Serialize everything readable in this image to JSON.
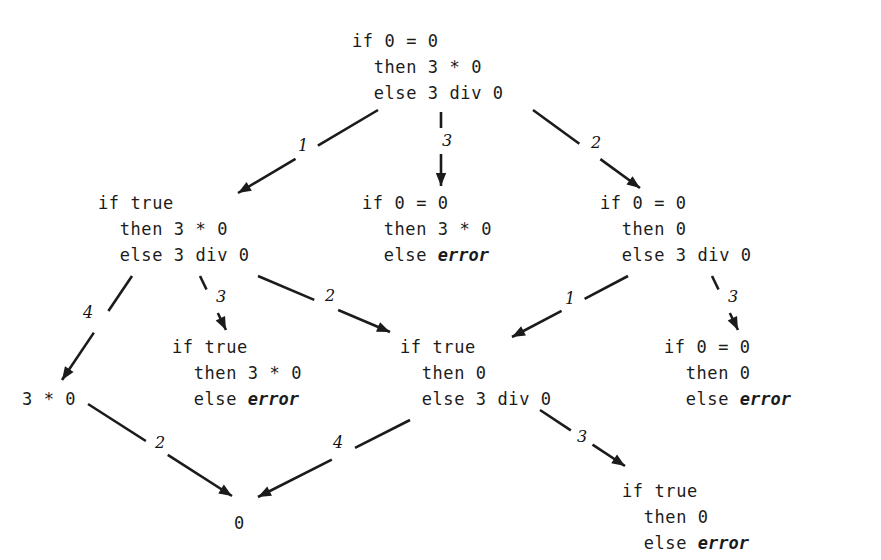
{
  "diagram": {
    "ink_color": "#1b1b1b",
    "background_color": "#ffffff",
    "error_token": "error",
    "nodes": [
      {
        "id": "n-root",
        "lines": [
          "if 0 = 0",
          "  then 3 * 0",
          "  else 3 div 0"
        ],
        "has_error": false,
        "x": 352,
        "y": 28
      },
      {
        "id": "n-l2-left",
        "lines": [
          "if true",
          "  then 3 * 0",
          "  else 3 div 0"
        ],
        "has_error": false,
        "x": 98,
        "y": 190
      },
      {
        "id": "n-l2-mid",
        "lines": [
          "if 0 = 0",
          "  then 3 * 0",
          "  else "
        ],
        "error_line_index": 2,
        "has_error": true,
        "x": 362,
        "y": 190
      },
      {
        "id": "n-l2-right",
        "lines": [
          "if 0 = 0",
          "  then 0",
          "  else 3 div 0"
        ],
        "has_error": false,
        "x": 600,
        "y": 190
      },
      {
        "id": "n-l3-left",
        "lines": [
          "if true",
          "  then 3 * 0",
          "  else "
        ],
        "error_line_index": 2,
        "has_error": true,
        "x": 172,
        "y": 334
      },
      {
        "id": "n-l3-mid",
        "lines": [
          "if true",
          "  then 0",
          "  else 3 div 0"
        ],
        "has_error": false,
        "x": 400,
        "y": 334
      },
      {
        "id": "n-l3-right",
        "lines": [
          "if 0 = 0",
          "  then 0",
          "  else "
        ],
        "error_line_index": 2,
        "has_error": true,
        "x": 664,
        "y": 334
      },
      {
        "id": "n-l4-mul",
        "lines": [
          "3 * 0"
        ],
        "has_error": false,
        "x": 22,
        "y": 386
      },
      {
        "id": "n-l4-right",
        "lines": [
          "if true",
          "  then 0",
          "  else "
        ],
        "error_line_index": 2,
        "has_error": true,
        "x": 622,
        "y": 478
      },
      {
        "id": "n-bottom-zero",
        "lines": [
          "0"
        ],
        "has_error": false,
        "x": 234,
        "y": 510
      }
    ],
    "edges": [
      {
        "id": "e-root-left",
        "from": "n-root",
        "to": "n-l2-left",
        "label": "1",
        "x1": 378,
        "y1": 110,
        "x2": 238,
        "y2": 193,
        "label_x": 303,
        "label_y": 146,
        "gapped": true
      },
      {
        "id": "e-root-mid",
        "from": "n-root",
        "to": "n-l2-mid",
        "label": "3",
        "x1": 441,
        "y1": 112,
        "x2": 441,
        "y2": 186,
        "label_x": 447,
        "label_y": 141,
        "gapped": true
      },
      {
        "id": "e-root-right",
        "from": "n-root",
        "to": "n-l2-right",
        "label": "2",
        "x1": 533,
        "y1": 110,
        "x2": 640,
        "y2": 188,
        "label_x": 596,
        "label_y": 143,
        "gapped": true
      },
      {
        "id": "e-l2left-mul",
        "from": "n-l2-left",
        "to": "n-l4-mul",
        "label": "4",
        "x1": 132,
        "y1": 276,
        "x2": 62,
        "y2": 380,
        "label_x": 88,
        "label_y": 313,
        "gapped": true
      },
      {
        "id": "e-l2left-l3left",
        "from": "n-l2-left",
        "to": "n-l3-left",
        "label": "3",
        "x1": 200,
        "y1": 276,
        "x2": 226,
        "y2": 330,
        "label_x": 221,
        "label_y": 297,
        "gapped": true
      },
      {
        "id": "e-l2left-l3mid",
        "from": "n-l2-left",
        "to": "n-l3-mid",
        "label": "2",
        "x1": 258,
        "y1": 276,
        "x2": 390,
        "y2": 332,
        "label_x": 330,
        "label_y": 296,
        "gapped": true
      },
      {
        "id": "e-l2right-l3mid",
        "from": "n-l2-right",
        "to": "n-l3-mid",
        "label": "1",
        "x1": 628,
        "y1": 276,
        "x2": 512,
        "y2": 337,
        "label_x": 570,
        "label_y": 299,
        "gapped": true
      },
      {
        "id": "e-l2right-l3right",
        "from": "n-l2-right",
        "to": "n-l3-right",
        "label": "3",
        "x1": 712,
        "y1": 276,
        "x2": 738,
        "y2": 330,
        "label_x": 733,
        "label_y": 297,
        "gapped": true
      },
      {
        "id": "e-mul-zero",
        "from": "n-l4-mul",
        "to": "n-bottom-zero",
        "label": "2",
        "x1": 88,
        "y1": 404,
        "x2": 232,
        "y2": 496,
        "label_x": 160,
        "label_y": 443,
        "gapped": true
      },
      {
        "id": "e-l3mid-zero",
        "from": "n-l3-mid",
        "to": "n-bottom-zero",
        "label": "4",
        "x1": 410,
        "y1": 420,
        "x2": 258,
        "y2": 497,
        "label_x": 338,
        "label_y": 443,
        "gapped": true
      },
      {
        "id": "e-l3mid-l4right",
        "from": "n-l3-mid",
        "to": "n-l4-right",
        "label": "3",
        "x1": 540,
        "y1": 410,
        "x2": 625,
        "y2": 466,
        "label_x": 582,
        "label_y": 437,
        "gapped": true
      }
    ]
  }
}
